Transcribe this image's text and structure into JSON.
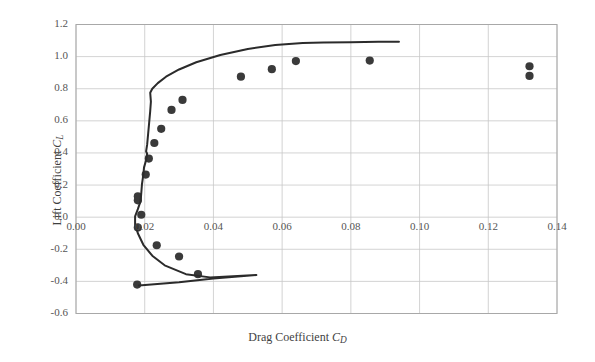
{
  "chart_data": {
    "type": "scatter",
    "title": "",
    "xlabel": "Drag Coefficient C_D",
    "ylabel": "Lift Coefficient C_L",
    "xlabel_parts": {
      "text": "Drag Coefficient ",
      "symbol": "C",
      "subscript": "D"
    },
    "ylabel_parts": {
      "text": "Lift Coefficient ",
      "symbol": "C",
      "subscript": "L"
    },
    "xlim": [
      0.0,
      0.14
    ],
    "ylim": [
      -0.6,
      1.2
    ],
    "xticks": [
      "0.00",
      "0.02",
      "0.04",
      "0.06",
      "0.08",
      "0.10",
      "0.12",
      "0.14"
    ],
    "xtick_values": [
      0.0,
      0.02,
      0.04,
      0.06,
      0.08,
      0.1,
      0.12,
      0.14
    ],
    "yticks": [
      "1.2",
      "1.0",
      "0.8",
      "0.6",
      "0.4",
      "0.2",
      "0.0",
      "-0.2",
      "-0.4",
      "-0.6"
    ],
    "ytick_values": [
      1.2,
      1.0,
      0.8,
      0.6,
      0.4,
      0.2,
      0.0,
      -0.2,
      -0.4,
      -0.6
    ],
    "grid": true,
    "legend": "none",
    "colors": {
      "marker": "#3a3a3a",
      "line": "#2b2b2b",
      "grid": "#c8c8c8",
      "frame": "#a8a8a8"
    },
    "series": [
      {
        "name": "Experimental data",
        "type": "scatter",
        "marker": "filled-circle",
        "points": [
          [
            0.0178,
            -0.42
          ],
          [
            0.0355,
            -0.355
          ],
          [
            0.03,
            -0.245
          ],
          [
            0.0235,
            -0.175
          ],
          [
            0.018,
            -0.065
          ],
          [
            0.019,
            0.015
          ],
          [
            0.018,
            0.105
          ],
          [
            0.018,
            0.13
          ],
          [
            0.0203,
            0.265
          ],
          [
            0.0212,
            0.365
          ],
          [
            0.0228,
            0.462
          ],
          [
            0.0248,
            0.55
          ],
          [
            0.0278,
            0.668
          ],
          [
            0.031,
            0.73
          ],
          [
            0.048,
            0.875
          ],
          [
            0.057,
            0.922
          ],
          [
            0.064,
            0.972
          ],
          [
            0.0855,
            0.975
          ],
          [
            0.132,
            0.94
          ],
          [
            0.132,
            0.88
          ]
        ]
      },
      {
        "name": "Predicted drag polar",
        "type": "line",
        "points": [
          [
            0.0183,
            -0.425
          ],
          [
            0.03,
            -0.405
          ],
          [
            0.04,
            -0.382
          ],
          [
            0.048,
            -0.368
          ],
          [
            0.0525,
            -0.36
          ],
          [
            0.039,
            -0.375
          ],
          [
            0.032,
            -0.355
          ],
          [
            0.0258,
            -0.3
          ],
          [
            0.0222,
            -0.24
          ],
          [
            0.0196,
            -0.172
          ],
          [
            0.018,
            -0.1
          ],
          [
            0.0172,
            -0.045
          ],
          [
            0.0172,
            0.005
          ],
          [
            0.018,
            0.05
          ],
          [
            0.0188,
            0.1
          ],
          [
            0.019,
            0.15
          ],
          [
            0.0192,
            0.205
          ],
          [
            0.0196,
            0.265
          ],
          [
            0.0198,
            0.31
          ],
          [
            0.0204,
            0.355
          ],
          [
            0.0207,
            0.395
          ],
          [
            0.0204,
            0.41
          ],
          [
            0.0207,
            0.45
          ],
          [
            0.021,
            0.52
          ],
          [
            0.0213,
            0.59
          ],
          [
            0.0216,
            0.66
          ],
          [
            0.0218,
            0.72
          ],
          [
            0.0216,
            0.775
          ],
          [
            0.0222,
            0.8
          ],
          [
            0.0238,
            0.835
          ],
          [
            0.0262,
            0.875
          ],
          [
            0.03,
            0.92
          ],
          [
            0.035,
            0.965
          ],
          [
            0.042,
            1.01
          ],
          [
            0.05,
            1.048
          ],
          [
            0.058,
            1.072
          ],
          [
            0.066,
            1.085
          ],
          [
            0.072,
            1.088
          ],
          [
            0.08,
            1.09
          ],
          [
            0.088,
            1.092
          ],
          [
            0.094,
            1.093
          ]
        ]
      }
    ]
  },
  "figure": {
    "background": "#ffffff"
  }
}
